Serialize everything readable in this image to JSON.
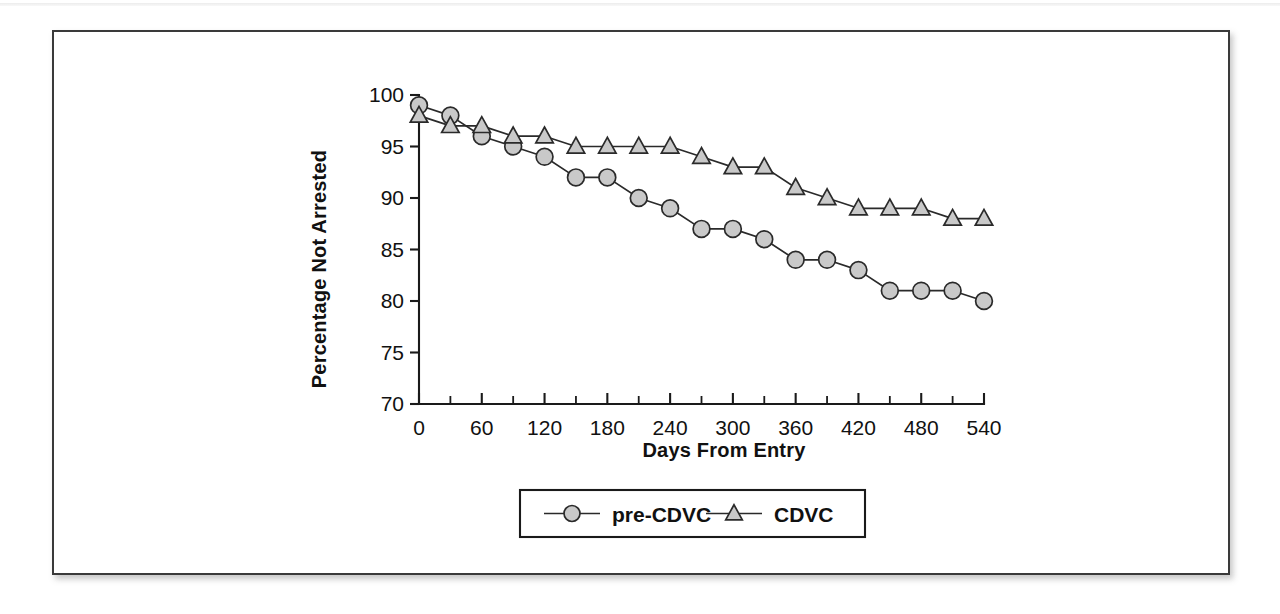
{
  "figure": {
    "frame_border_color": "#3a3a3a",
    "background_color": "#ffffff"
  },
  "chart_data": {
    "type": "line",
    "title": "",
    "xlabel": "Days From Entry",
    "ylabel": "Percentage Not Arrested",
    "xlim": [
      0,
      540
    ],
    "ylim": [
      70,
      100
    ],
    "x_major_ticks": [
      0,
      60,
      120,
      180,
      240,
      300,
      360,
      420,
      480,
      540
    ],
    "x_major_tick_labels": [
      "0",
      "60",
      "120",
      "180",
      "240",
      "300",
      "360",
      "420",
      "480",
      "540"
    ],
    "x_minor_tick_interval": 30,
    "y_major_ticks": [
      70,
      75,
      80,
      85,
      90,
      95,
      100
    ],
    "y_major_tick_labels": [
      "70",
      "75",
      "80",
      "85",
      "90",
      "95",
      "100"
    ],
    "grid": false,
    "legend_position": "bottom-center",
    "x": [
      0,
      30,
      60,
      90,
      120,
      150,
      180,
      210,
      240,
      270,
      300,
      330,
      360,
      390,
      420,
      450,
      480,
      510,
      540
    ],
    "series": [
      {
        "name": "pre-CDVC",
        "marker": "circle",
        "marker_fill": "#c9c9c9",
        "marker_edge": "#2a2a2a",
        "line_color": "#2a2a2a",
        "values": [
          99,
          98,
          96,
          95,
          94,
          92,
          92,
          90,
          89,
          87,
          87,
          86,
          84,
          84,
          83,
          81,
          81,
          81,
          80
        ]
      },
      {
        "name": "CDVC",
        "marker": "triangle",
        "marker_fill": "#c9c9c9",
        "marker_edge": "#2a2a2a",
        "line_color": "#2a2a2a",
        "values": [
          98,
          97,
          97,
          96,
          96,
          95,
          95,
          95,
          95,
          94,
          93,
          93,
          91,
          90,
          89,
          89,
          89,
          88,
          88
        ]
      }
    ]
  },
  "legend": {
    "entries": [
      {
        "label": "pre-CDVC",
        "marker": "circle"
      },
      {
        "label": "CDVC",
        "marker": "triangle"
      }
    ]
  }
}
